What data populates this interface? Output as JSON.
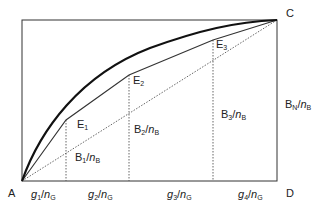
{
  "diagram": {
    "type": "lorenz-style curve diagram",
    "corners": {
      "A": "A",
      "C": "C",
      "D": "D"
    },
    "points": [
      {
        "id": "E1",
        "label": "E",
        "sub": "1"
      },
      {
        "id": "E2",
        "label": "E",
        "sub": "2"
      },
      {
        "id": "E3",
        "label": "E",
        "sub": "3"
      }
    ],
    "vertical_labels": [
      {
        "base": "B",
        "sub": "1",
        "slash": "/",
        "den": "n",
        "den_sub": "B"
      },
      {
        "base": "B",
        "sub": "2",
        "slash": "/",
        "den": "n",
        "den_sub": "B"
      },
      {
        "base": "B",
        "sub": "3",
        "slash": "/",
        "den": "n",
        "den_sub": "B"
      },
      {
        "base": "B",
        "sub": "N",
        "slash": "/",
        "den": "n",
        "den_sub": "B"
      }
    ],
    "horizontal_labels": [
      {
        "base": "g",
        "sub": "1",
        "slash": "/",
        "den": "n",
        "den_sub": "G"
      },
      {
        "base": "g",
        "sub": "2",
        "slash": "/",
        "den": "n",
        "den_sub": "G"
      },
      {
        "base": "g",
        "sub": "3",
        "slash": "/",
        "den": "n",
        "den_sub": "G"
      },
      {
        "base": "g",
        "sub": "4",
        "slash": "/",
        "den": "n",
        "den_sub": "G"
      }
    ],
    "colors": {
      "line": "#222222",
      "curve": "#111111",
      "dotted": "#555555"
    }
  }
}
